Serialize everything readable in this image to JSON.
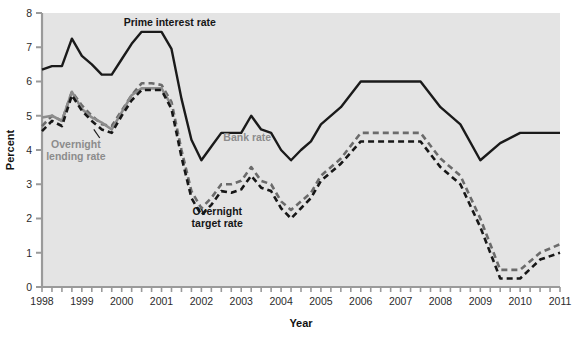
{
  "chart_data": {
    "type": "line",
    "title": "",
    "xlabel": "Year",
    "ylabel": "Percent",
    "xlim": [
      1998,
      2011
    ],
    "ylim": [
      0,
      8
    ],
    "yticks": [
      0,
      1,
      2,
      3,
      4,
      5,
      6,
      7,
      8
    ],
    "ytick_labels": [
      "0",
      "1",
      "2",
      "3",
      "4",
      "5",
      "6",
      "7",
      "8"
    ],
    "xticks": [
      1998,
      1999,
      2000,
      2001,
      2002,
      2003,
      2004,
      2005,
      2006,
      2007,
      2008,
      2009,
      2010,
      2011
    ],
    "xtick_labels": [
      "1998",
      "1999",
      "2000",
      "2001",
      "2002",
      "2003",
      "2004",
      "2005",
      "2006",
      "2007",
      "2008",
      "2009",
      "2010",
      "2011"
    ],
    "minor_xticks_per_year": 4,
    "grid": false,
    "legend_position": "inline-annotations",
    "plot_background": "#e4e4e4",
    "series": [
      {
        "name": "Prime interest rate",
        "style": "solid",
        "color": "#1a1a1a",
        "label_x": 2000.05,
        "label_y": 7.62,
        "x": [
          1998.0,
          1998.25,
          1998.5,
          1998.75,
          1999.0,
          1999.25,
          1999.5,
          1999.75,
          2000.0,
          2000.25,
          2000.5,
          2000.75,
          2001.0,
          2001.25,
          2001.5,
          2001.75,
          2002.0,
          2002.25,
          2002.5,
          2002.75,
          2003.0,
          2003.25,
          2003.5,
          2003.75,
          2004.0,
          2004.25,
          2004.5,
          2004.75,
          2005.0,
          2005.5,
          2006.0,
          2006.5,
          2007.0,
          2007.5,
          2008.0,
          2008.5,
          2009.0,
          2009.5,
          2010.0,
          2010.5,
          2011.0
        ],
        "y": [
          6.35,
          6.45,
          6.45,
          7.25,
          6.75,
          6.5,
          6.2,
          6.2,
          6.65,
          7.1,
          7.45,
          7.45,
          7.45,
          6.95,
          5.5,
          4.3,
          3.7,
          4.1,
          4.5,
          4.5,
          4.5,
          5.0,
          4.6,
          4.5,
          4.0,
          3.7,
          4.0,
          4.25,
          4.75,
          5.25,
          6.0,
          6.0,
          6.0,
          6.0,
          5.25,
          4.75,
          3.7,
          4.2,
          4.5,
          4.5,
          4.5
        ],
        "y_note": "values in percent"
      },
      {
        "name": "Bank rate",
        "style": "dashed",
        "color": "#6b6b6b",
        "label_x": 2002.55,
        "label_y": 4.25,
        "x": [
          1998.0,
          1998.25,
          1998.5,
          1998.75,
          1999.0,
          1999.25,
          1999.5,
          1999.75,
          2000.0,
          2000.25,
          2000.5,
          2000.75,
          2001.0,
          2001.25,
          2001.5,
          2001.75,
          2002.0,
          2002.25,
          2002.5,
          2002.75,
          2003.0,
          2003.25,
          2003.5,
          2003.75,
          2004.0,
          2004.25,
          2004.5,
          2004.75,
          2005.0,
          2005.5,
          2006.0,
          2006.5,
          2007.0,
          2007.5,
          2008.0,
          2008.5,
          2009.0,
          2009.5,
          2010.0,
          2010.5,
          2011.0
        ],
        "y": [
          4.7,
          5.0,
          4.85,
          5.7,
          5.3,
          5.0,
          4.75,
          4.7,
          5.15,
          5.6,
          5.95,
          5.95,
          5.9,
          5.4,
          4.0,
          2.8,
          2.3,
          2.6,
          3.0,
          3.0,
          3.1,
          3.5,
          3.1,
          3.0,
          2.5,
          2.25,
          2.5,
          2.75,
          3.25,
          3.75,
          4.5,
          4.5,
          4.5,
          4.5,
          3.75,
          3.25,
          2.0,
          0.5,
          0.5,
          1.0,
          1.25
        ]
      },
      {
        "name": "Overnight lending rate",
        "style": "solid-gray",
        "color": "#8c8c8c",
        "label_x": 1998.85,
        "label_y": 4.05,
        "x": [
          1998.0,
          1998.25,
          1998.5,
          1998.75,
          1999.0,
          1999.25,
          1999.5,
          1999.75,
          2000.0,
          2000.25,
          2000.5,
          2000.75,
          2001.0,
          2001.25
        ],
        "y": [
          4.95,
          5.0,
          4.85,
          5.7,
          5.2,
          4.95,
          4.8,
          4.6,
          5.1,
          5.6,
          5.8,
          5.8,
          5.8,
          5.3
        ]
      },
      {
        "name": "Overnight target rate",
        "style": "dashed-dark",
        "color": "#171717",
        "label_x": 2002.4,
        "label_y": 2.1,
        "x": [
          1998.0,
          1998.25,
          1998.5,
          1998.75,
          1999.0,
          1999.25,
          1999.5,
          1999.75,
          2000.0,
          2000.25,
          2000.5,
          2000.75,
          2001.0,
          2001.25,
          2001.5,
          2001.75,
          2002.0,
          2002.25,
          2002.5,
          2002.75,
          2003.0,
          2003.25,
          2003.5,
          2003.75,
          2004.0,
          2004.25,
          2004.5,
          2004.75,
          2005.0,
          2005.5,
          2006.0,
          2006.5,
          2007.0,
          2007.5,
          2008.0,
          2008.5,
          2009.0,
          2009.5,
          2010.0,
          2010.5,
          2011.0
        ],
        "y": [
          4.55,
          4.85,
          4.7,
          5.6,
          5.15,
          4.85,
          4.6,
          4.5,
          5.0,
          5.45,
          5.75,
          5.75,
          5.75,
          5.2,
          3.8,
          2.6,
          2.1,
          2.4,
          2.8,
          2.75,
          2.85,
          3.25,
          2.9,
          2.8,
          2.3,
          2.0,
          2.3,
          2.6,
          3.1,
          3.6,
          4.25,
          4.25,
          4.25,
          4.25,
          3.5,
          3.0,
          1.75,
          0.25,
          0.25,
          0.8,
          1.0
        ]
      }
    ],
    "annotations": [
      {
        "name": "overnight-lending-pointer",
        "from_x": 1999.45,
        "from_y": 4.35,
        "to_x": 1999.3,
        "to_y": 4.6
      }
    ]
  },
  "labels": {
    "y_axis_title": "Percent",
    "x_axis_title": "Year",
    "prime_interest_rate": "Prime interest rate",
    "overnight_lending_rate_line1": "Overnight",
    "overnight_lending_rate_line2": "lending rate",
    "bank_rate": "Bank rate",
    "overnight_target_rate_line1": "Overnight",
    "overnight_target_rate_line2": "target rate"
  },
  "colors": {
    "prime": "#1a1a1a",
    "bank_rate": "#6b6b6b",
    "overnight_lending": "#8c8c8c",
    "overnight_target": "#171717",
    "plot_bg": "#e4e4e4",
    "page_bg": "#ffffff",
    "axis": "#9a9a9a",
    "text": "#1a1a1a"
  }
}
